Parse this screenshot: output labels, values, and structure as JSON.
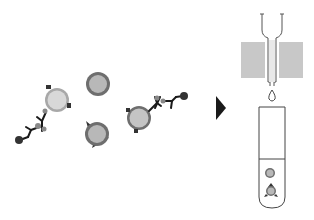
{
  "diagram": {
    "title": "",
    "colors": {
      "background": "#ffffff",
      "cell_outer_light": "#a8a8a8",
      "cell_inner_light": "#d4d4d4",
      "cell_outer_dark": "#6e6e6e",
      "cell_inner_dark": "#b4b4b4",
      "antibody": "#1a1a1a",
      "bead": "#333333",
      "magnet": "#c8c8c8",
      "line": "#333333",
      "arrow": "#1a1a1a"
    },
    "left_panel": {
      "cells": [
        {
          "id": "cell-labeled-1",
          "cx": 57,
          "cy": 100,
          "r": 12,
          "style": "light",
          "antibody_chain": true
        },
        {
          "id": "cell-unlabeled",
          "cx": 98,
          "cy": 84,
          "r": 12,
          "style": "dark"
        },
        {
          "id": "cell-spiked",
          "cx": 97,
          "cy": 134,
          "r": 12,
          "style": "dark",
          "spikes": true
        },
        {
          "id": "cell-labeled-2",
          "cx": 139,
          "cy": 118,
          "r": 12,
          "style": "dark",
          "antibody_chain": true
        }
      ]
    },
    "arrow": {
      "direction": "right"
    },
    "right_panel": {
      "column": {
        "label": ""
      },
      "magnet_blocks": 2,
      "droplet": true,
      "tube": {
        "cells_collected": 2
      }
    }
  }
}
